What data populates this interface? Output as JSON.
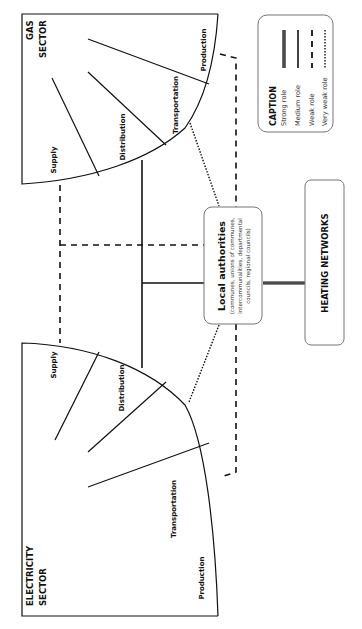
{
  "diagram": {
    "gas_sector": {
      "title_line1": "GAS",
      "title_line2": "SECTOR",
      "segments": [
        "Production",
        "Transportation",
        "Distribution",
        "Supply"
      ]
    },
    "electricity_sector": {
      "title_line1": "ELECTRICITY",
      "title_line2": "SECTOR",
      "segments": [
        "Production",
        "Transportation",
        "Distribution",
        "Supply"
      ]
    },
    "local_authorities": {
      "title": "Local authorities",
      "sub_line1": "(communes, unions of communes,",
      "sub_line2": "intercommunalities, departmental",
      "sub_line3": "councils, regional councils)"
    },
    "heating_networks": {
      "title": "HEATING NETWORKS"
    },
    "caption": {
      "title": "CAPTION",
      "items": [
        {
          "label": "Strong role",
          "style": "double-line"
        },
        {
          "label": "Medium role",
          "style": "solid"
        },
        {
          "label": "Weak role",
          "style": "dashed"
        },
        {
          "label": "Very weak role",
          "style": "dotted"
        }
      ]
    },
    "colors": {
      "line": "#111111",
      "strong": "#555555",
      "box_border": "#777777",
      "background": "#ffffff"
    }
  }
}
